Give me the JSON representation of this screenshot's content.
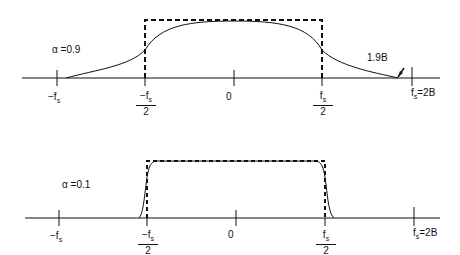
{
  "panels": [
    {
      "alpha_label": "α =0.9",
      "annotation": "1.9B",
      "ticks": {
        "neg_fs": "−f",
        "neg_half_fs_num": "−f",
        "half_den": "2",
        "zero": "0",
        "half_fs_num": "f",
        "fs_eq": "f",
        "fs_eq_suffix": "=2B",
        "sub": "s"
      }
    },
    {
      "alpha_label": "α =0.1",
      "ticks": {
        "neg_fs": "−f",
        "neg_half_fs_num": "−f",
        "half_den": "2",
        "zero": "0",
        "half_fs_num": "f",
        "fs_eq": "f",
        "fs_eq_suffix": "=2B",
        "sub": "s"
      }
    }
  ]
}
